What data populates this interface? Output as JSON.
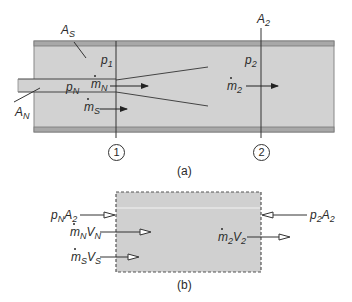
{
  "figure": {
    "part_a": {
      "caption": "(a)",
      "labels": {
        "A_S": {
          "base": "A",
          "sub": "S"
        },
        "A_2": {
          "base": "A",
          "sub": "2"
        },
        "p_1": {
          "base": "p",
          "sub": "1"
        },
        "p_2": {
          "base": "p",
          "sub": "2"
        },
        "p_N": {
          "base": "p",
          "sub": "N"
        },
        "mdot_N": {
          "base": "m",
          "sub": "N"
        },
        "mdot_S": {
          "base": "m",
          "sub": "S"
        },
        "mdot_2": {
          "base": "m",
          "sub": "2"
        },
        "A_N": {
          "base": "A",
          "sub": "N"
        }
      },
      "stations": [
        {
          "id": "1",
          "label": "1"
        },
        {
          "id": "2",
          "label": "2"
        }
      ]
    },
    "part_b": {
      "caption": "(b)",
      "labels": {
        "pN_A2": {
          "p": "p",
          "p_sub": "N",
          "a": "A",
          "a_sub": "2"
        },
        "mN_VN": {
          "m": "m",
          "m_sub": "N",
          "v": "V",
          "v_sub": "N"
        },
        "mS_VS": {
          "m": "m",
          "m_sub": "S",
          "v": "V",
          "v_sub": "S"
        },
        "m2_V2": {
          "m": "m",
          "m_sub": "2",
          "v": "V",
          "v_sub": "2"
        },
        "p2_A2": {
          "p": "p",
          "p_sub": "2",
          "a": "A",
          "a_sub": "2"
        }
      }
    },
    "colors": {
      "fill": "#d2d2d2",
      "wall": "#9a9a9a",
      "line": "#333333",
      "text": "#2a2a2a"
    }
  }
}
